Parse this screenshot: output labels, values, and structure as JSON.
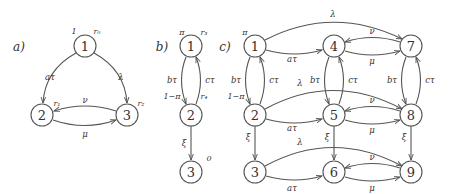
{
  "colors": {
    "stroke": "#555555",
    "text": "#333333",
    "background": "#ffffff"
  },
  "panels": {
    "a": {
      "label": "a)",
      "nodes": [
        {
          "id": "1",
          "label": "1",
          "annotations": [
            "1",
            "r0"
          ]
        },
        {
          "id": "2",
          "label": "2",
          "annotations": [
            "r1"
          ]
        },
        {
          "id": "3",
          "label": "3",
          "annotations": [
            "r2"
          ]
        }
      ],
      "edges": [
        {
          "from": "1",
          "to": "2",
          "label": "aτ"
        },
        {
          "from": "1",
          "to": "3",
          "label": "λ"
        },
        {
          "from": "3",
          "to": "2",
          "label": "ν"
        },
        {
          "from": "2",
          "to": "3",
          "label": "μ"
        }
      ],
      "annot": {
        "n1_left": "1",
        "n1_right": "r₀",
        "n2": "r₁",
        "n3": "r₂"
      }
    },
    "b": {
      "label": "b)",
      "nodes": [
        {
          "id": "1",
          "label": "1"
        },
        {
          "id": "2",
          "label": "2"
        },
        {
          "id": "3",
          "label": "3"
        }
      ],
      "edges": [
        {
          "from": "1",
          "to": "2",
          "label": "bτ"
        },
        {
          "from": "2",
          "to": "1",
          "label": "cτ"
        },
        {
          "from": "2",
          "to": "3",
          "label": "ξ"
        }
      ],
      "annot": {
        "n1_left": "π",
        "n1_right": "r₃",
        "n2_left": "1−π",
        "n2_right": "r₄",
        "n3": "0"
      }
    },
    "c": {
      "label": "c)",
      "nodes": [
        "1",
        "2",
        "3",
        "4",
        "5",
        "6",
        "7",
        "8",
        "9"
      ],
      "edges": [
        {
          "from": "1",
          "to": "4",
          "label": "aτ"
        },
        {
          "from": "1",
          "to": "7",
          "label": "λ"
        },
        {
          "from": "7",
          "to": "4",
          "label": "ν"
        },
        {
          "from": "4",
          "to": "7",
          "label": "μ"
        },
        {
          "from": "1",
          "to": "2",
          "label": "bτ"
        },
        {
          "from": "2",
          "to": "1",
          "label": "cτ"
        },
        {
          "from": "4",
          "to": "5",
          "label": "bτ"
        },
        {
          "from": "5",
          "to": "4",
          "label": "cτ"
        },
        {
          "from": "7",
          "to": "8",
          "label": "bτ"
        },
        {
          "from": "8",
          "to": "7",
          "label": "cτ"
        },
        {
          "from": "2",
          "to": "5",
          "label": "aτ"
        },
        {
          "from": "2",
          "to": "8",
          "label": "λ"
        },
        {
          "from": "8",
          "to": "5",
          "label": "ν"
        },
        {
          "from": "5",
          "to": "8",
          "label": "μ"
        },
        {
          "from": "2",
          "to": "3",
          "label": "ξ"
        },
        {
          "from": "5",
          "to": "6",
          "label": "ξ"
        },
        {
          "from": "8",
          "to": "9",
          "label": "ξ"
        },
        {
          "from": "3",
          "to": "6",
          "label": "aτ"
        },
        {
          "from": "3",
          "to": "9",
          "label": "λ"
        },
        {
          "from": "9",
          "to": "6",
          "label": "ν"
        },
        {
          "from": "6",
          "to": "9",
          "label": "μ"
        }
      ],
      "annot": {
        "n1": "π",
        "n2": "1−π"
      }
    }
  },
  "text": {
    "a_label": "a)",
    "b_label": "b)",
    "c_label": "c)",
    "n1": "1",
    "n2": "2",
    "n3": "3",
    "n4": "4",
    "n5": "5",
    "n6": "6",
    "n7": "7",
    "n8": "8",
    "n9": "9",
    "a_tau": "aτ",
    "b_tau": "bτ",
    "c_tau": "cτ",
    "lambda": "λ",
    "mu": "μ",
    "nu": "ν",
    "xi": "ξ",
    "one": "1",
    "r0": "r₀",
    "r1": "r₁",
    "r2": "r₂",
    "r3": "r₃",
    "r4": "r₄",
    "pi": "π",
    "one_minus_pi": "1−π",
    "zero": "0"
  }
}
